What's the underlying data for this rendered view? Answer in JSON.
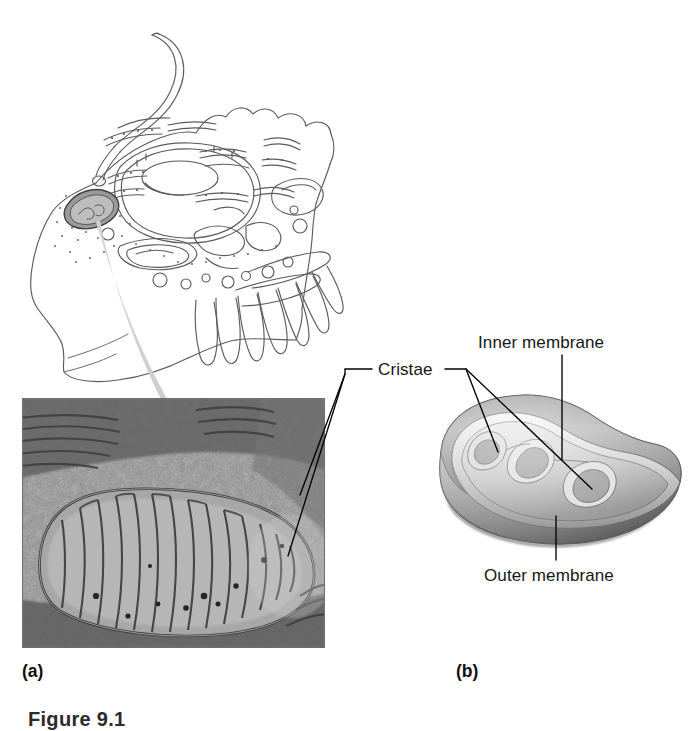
{
  "figure": {
    "caption": "Figure 9.1"
  },
  "panels": [
    {
      "letter": "(a)",
      "name": "panel-a-micrograph",
      "content": "transmission electron micrograph of a mitochondrion in a cell"
    },
    {
      "letter": "(b)",
      "name": "panel-b-illustration",
      "content": "cutaway three dimensional drawing of a mitochondrion"
    }
  ],
  "labels": {
    "cristae": "Cristae",
    "inner_membrane": "Inner membrane",
    "outer_membrane": "Outer membrane"
  },
  "illustrations": {
    "cell_overview": "line drawing of a eukaryotic cell with a flagellum, nucleus, endoplasmic reticulum, Golgi, microvilli and a highlighted mitochondrion",
    "zoom_arrow": "shaded arrow leading from the mitochondrion in the cell drawing down into the micrograph"
  },
  "colors": {
    "background": "#ffffff",
    "text": "#161616",
    "leader_line": "#000000",
    "micrograph_dark": "#4a4a4a",
    "micrograph_light": "#b9b9b9",
    "arrow_gray": "#c8c8c8",
    "membrane_dark": "#6e6e6e",
    "membrane_light": "#e2e2e2",
    "cell_outline": "#555555"
  }
}
